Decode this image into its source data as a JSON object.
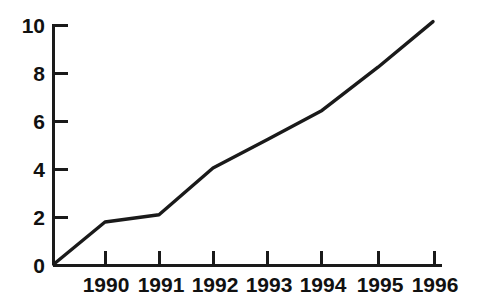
{
  "chart_data": {
    "type": "line",
    "title": "",
    "subtitle": "",
    "xlabel": "",
    "ylabel": "",
    "x": [
      "1990",
      "1991",
      "1992",
      "1993",
      "1994",
      "1995",
      "1996"
    ],
    "categories": [
      "1990",
      "1991",
      "1992",
      "1993",
      "1994",
      "1995",
      "1996"
    ],
    "values": [
      1.75,
      2.05,
      4.0,
      5.2,
      6.4,
      8.2,
      10.1
    ],
    "series": [
      {
        "name": "series-1",
        "values": [
          1.75,
          2.05,
          4.0,
          5.2,
          6.4,
          8.2,
          10.1
        ]
      }
    ],
    "origin_value": 0,
    "xlim": [
      "1989",
      "1996"
    ],
    "ylim": [
      0,
      10
    ],
    "ytick_labels": [
      "0",
      "2",
      "4",
      "6",
      "8",
      "10"
    ],
    "ytick_values": [
      0,
      2,
      4,
      6,
      8,
      10
    ],
    "xtick_labels": [
      "1990",
      "1991",
      "1992",
      "1993",
      "1994",
      "1995",
      "1996"
    ],
    "grid": false,
    "legend": false,
    "legend_position": "none",
    "annotations": [],
    "line_color": "#1a1a1a",
    "axis_color": "#1a1a1a",
    "background_color": "#ffffff",
    "tick_direction_y": "right",
    "tick_direction_x": "up"
  },
  "axes": {
    "y_ticks": [
      {
        "label": "10",
        "value": 10
      },
      {
        "label": "8",
        "value": 8
      },
      {
        "label": "6",
        "value": 6
      },
      {
        "label": "4",
        "value": 4
      },
      {
        "label": "2",
        "value": 2
      },
      {
        "label": "0",
        "value": 0
      }
    ],
    "x_ticks": [
      {
        "label": "1990"
      },
      {
        "label": "1991"
      },
      {
        "label": "1992"
      },
      {
        "label": "1993"
      },
      {
        "label": "1994"
      },
      {
        "label": "1995"
      },
      {
        "label": "1996"
      }
    ]
  }
}
